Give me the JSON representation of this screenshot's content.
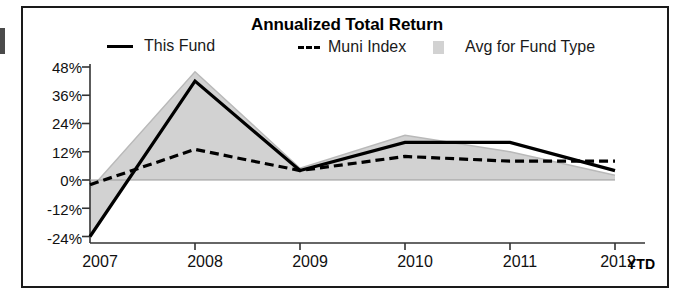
{
  "chart_data": {
    "type": "line",
    "title": "Annualized Total Return",
    "xlabel": "",
    "ylabel": "",
    "categories": [
      "2007",
      "2008",
      "2009",
      "2010",
      "2011",
      "2012"
    ],
    "x_tick_labels": [
      "2007",
      "2008",
      "2009",
      "2010",
      "2011",
      "2012"
    ],
    "x_axis_suffix_label": "YTD",
    "y_tick_labels": [
      "48%",
      "36%",
      "24%",
      "12%",
      "0%",
      "-12%",
      "-24%"
    ],
    "y_tick_values": [
      48,
      36,
      24,
      12,
      0,
      -12,
      -24
    ],
    "ylim": [
      -27,
      50
    ],
    "grid": false,
    "legend_position": "top",
    "series": [
      {
        "name": "This Fund",
        "style": "solid-line",
        "color": "#000000",
        "values": [
          -24,
          42,
          4,
          16,
          16,
          4
        ]
      },
      {
        "name": "Muni Index",
        "style": "dashed-line",
        "color": "#000000",
        "values": [
          -2,
          13,
          4,
          10,
          8,
          8
        ]
      },
      {
        "name": "Avg for Fund Type",
        "style": "filled-area",
        "color": "#d2d2d2",
        "values": [
          -4,
          46,
          5,
          19,
          12,
          2
        ]
      }
    ]
  },
  "legend": {
    "items": [
      {
        "label": "This Fund",
        "marker": "solid-line-swatch"
      },
      {
        "label": "Muni Index",
        "marker": "dashed-line-swatch"
      },
      {
        "label": "Avg for Fund Type",
        "marker": "gray-square-swatch"
      }
    ]
  },
  "axis": {
    "y_ticks": [
      "48%",
      "36%",
      "24%",
      "12%",
      "0%",
      "-12%",
      "-24%"
    ],
    "x_ticks": [
      "2007",
      "2008",
      "2009",
      "2010",
      "2011",
      "2012"
    ],
    "ytd": "YTD"
  },
  "colors": {
    "area_fill": "#d2d2d2",
    "line": "#000000",
    "frame": "#1a1a1a",
    "text": "#111111",
    "background": "#ffffff"
  }
}
